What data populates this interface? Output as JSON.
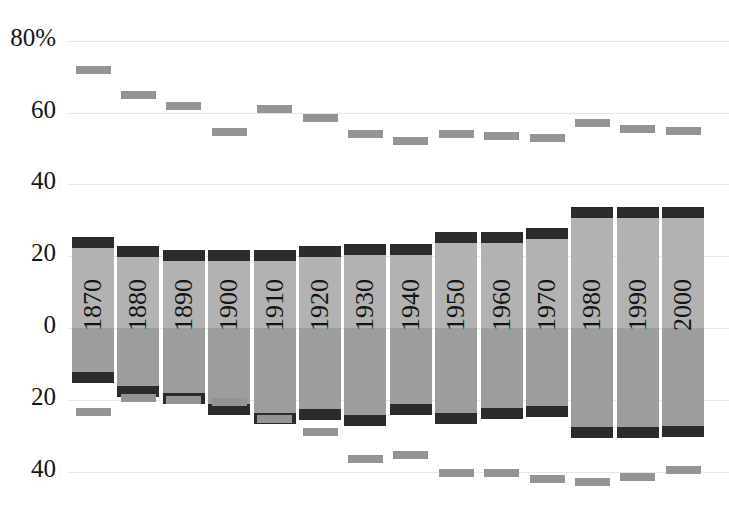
{
  "chart_data": {
    "type": "bar",
    "title": "",
    "subtitle": "",
    "xlabel": "",
    "ylabel": "",
    "grid": true,
    "legend_position": "none",
    "axis_note": "Diverging axis: values above the zero line are positive (top half, 0 to 80%), values below the zero line are shown as positive magnitudes on a mirrored scale (0 to 40%).",
    "categories": [
      "1870",
      "1880",
      "1890",
      "1900",
      "1910",
      "1920",
      "1930",
      "1940",
      "1950",
      "1960",
      "1970",
      "1980",
      "1990",
      "2000"
    ],
    "yticks_top": [
      "80%",
      "60",
      "40",
      "20",
      "0"
    ],
    "yticks_bottom": [
      "20",
      "40"
    ],
    "ytick_values_top": [
      80,
      60,
      40,
      20,
      0
    ],
    "ytick_values_bottom": [
      20,
      40
    ],
    "ylim": [
      -40,
      80
    ],
    "series": [
      {
        "name": "upper bar (above zero)",
        "values": [
          25.0,
          22.5,
          21.5,
          21.5,
          21.5,
          22.5,
          23.0,
          23.0,
          26.5,
          26.5,
          27.5,
          33.5,
          33.5,
          33.5
        ]
      },
      {
        "name": "lower bar (below zero, magnitude)",
        "values": [
          15.0,
          19.0,
          21.0,
          24.0,
          26.5,
          25.5,
          27.0,
          24.0,
          26.5,
          25.0,
          24.5,
          30.5,
          30.5,
          30.0
        ]
      },
      {
        "name": "upper cap top value",
        "values": [
          25.0,
          22.5,
          21.5,
          21.5,
          21.5,
          22.5,
          23.0,
          23.0,
          26.5,
          26.5,
          27.5,
          33.5,
          33.5,
          33.5
        ]
      },
      {
        "name": "standalone upper marker (%)",
        "values": [
          72.0,
          65.0,
          62.0,
          54.5,
          61.0,
          58.5,
          54.0,
          52.0,
          54.0,
          53.5,
          53.0,
          57.0,
          55.5,
          55.0
        ]
      },
      {
        "name": "standalone lower marker (%)",
        "values": [
          23.5,
          19.5,
          20.0,
          20.5,
          25.5,
          29.0,
          36.5,
          35.5,
          40.5,
          40.5,
          42.0,
          43.0,
          41.5,
          39.5
        ]
      }
    ],
    "bars": [
      {
        "year": "1870",
        "top": 25.0,
        "bottom": 15.0,
        "upper_marker": 72.0,
        "lower_marker": 23.5
      },
      {
        "year": "1880",
        "top": 22.5,
        "bottom": 19.0,
        "upper_marker": 65.0,
        "lower_marker": 19.5
      },
      {
        "year": "1890",
        "top": 21.5,
        "bottom": 21.0,
        "upper_marker": 62.0,
        "lower_marker": 20.0
      },
      {
        "year": "1900",
        "top": 21.5,
        "bottom": 24.0,
        "upper_marker": 54.5,
        "lower_marker": 20.5
      },
      {
        "year": "1910",
        "top": 21.5,
        "bottom": 26.5,
        "upper_marker": 61.0,
        "lower_marker": 25.5
      },
      {
        "year": "1920",
        "top": 22.5,
        "bottom": 25.5,
        "upper_marker": 58.5,
        "lower_marker": 29.0
      },
      {
        "year": "1930",
        "top": 23.0,
        "bottom": 27.0,
        "upper_marker": 54.0,
        "lower_marker": 36.5
      },
      {
        "year": "1940",
        "top": 23.0,
        "bottom": 24.0,
        "upper_marker": 52.0,
        "lower_marker": 35.5
      },
      {
        "year": "1950",
        "top": 26.5,
        "bottom": 26.5,
        "upper_marker": 54.0,
        "lower_marker": 40.5
      },
      {
        "year": "1960",
        "top": 26.5,
        "bottom": 25.0,
        "upper_marker": 53.5,
        "lower_marker": 40.5
      },
      {
        "year": "1970",
        "top": 27.5,
        "bottom": 24.5,
        "upper_marker": 53.0,
        "lower_marker": 42.0
      },
      {
        "year": "1980",
        "top": 33.5,
        "bottom": 30.5,
        "upper_marker": 57.0,
        "lower_marker": 43.0
      },
      {
        "year": "1990",
        "top": 33.5,
        "bottom": 30.5,
        "upper_marker": 55.5,
        "lower_marker": 41.5
      },
      {
        "year": "2000",
        "top": 33.5,
        "bottom": 30.0,
        "upper_marker": 55.0,
        "lower_marker": 39.5
      }
    ],
    "colors": {
      "bar_positive": "#b2b2b2",
      "bar_negative": "#9d9d9d",
      "cap": "#2b2b2b",
      "marker": "#949494",
      "grid": "#e6e6e6",
      "text": "#141414",
      "background": "#ffffff"
    }
  }
}
